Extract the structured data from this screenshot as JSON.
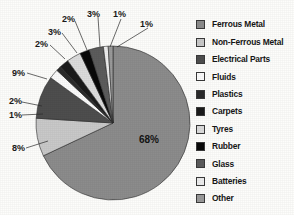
{
  "chart_data": {
    "type": "pie",
    "title": "",
    "legend_position": "right",
    "categories": [
      "Ferrous Metal",
      "Non-Ferrous Metal",
      "Electrical Parts",
      "Fluids",
      "Plastics",
      "Carpets",
      "Tyres",
      "Rubber",
      "Glass",
      "Batteries",
      "Other"
    ],
    "values": [
      68,
      8,
      9,
      2,
      1,
      2,
      3,
      2,
      3,
      1,
      1
    ],
    "value_labels": [
      "68%",
      "8%",
      "9%",
      "2%",
      "1%",
      "2%",
      "3%",
      "2%",
      "3%",
      "1%",
      "1%"
    ],
    "colors": [
      "#8c8c8c",
      "#c9c9c9",
      "#4e4e4e",
      "#fbfbfb",
      "#2b2b2b",
      "#1b1b1b",
      "#dcdcdc",
      "#090909",
      "#5c5c5c",
      "#ededed",
      "#9a9a9a"
    ]
  },
  "legend": {
    "items": [
      {
        "label": "Ferrous Metal",
        "color": "#8c8c8c"
      },
      {
        "label": "Non-Ferrous Metal",
        "color": "#c9c9c9"
      },
      {
        "label": "Electrical Parts",
        "color": "#4e4e4e"
      },
      {
        "label": "Fluids",
        "color": "#fbfbfb"
      },
      {
        "label": "Plastics",
        "color": "#2b2b2b"
      },
      {
        "label": "Carpets",
        "color": "#1b1b1b"
      },
      {
        "label": "Tyres",
        "color": "#dcdcdc"
      },
      {
        "label": "Rubber",
        "color": "#090909"
      },
      {
        "label": "Glass",
        "color": "#5c5c5c"
      },
      {
        "label": "Batteries",
        "color": "#ededed"
      },
      {
        "label": "Other",
        "color": "#9a9a9a"
      }
    ]
  },
  "pie_geometry": {
    "cx": 113,
    "cy": 123,
    "r": 77
  },
  "callouts": [
    {
      "text": "68%",
      "x": 139,
      "y": 143,
      "leader": false
    },
    {
      "text": "8%",
      "x": 12,
      "y": 151,
      "leader": true,
      "lx1": 26,
      "ly1": 148,
      "lx2": 48,
      "ly2": 141
    },
    {
      "text": "1%",
      "x": 9,
      "y": 118,
      "leader": true,
      "lx1": 22,
      "ly1": 115,
      "lx2": 43,
      "ly2": 114
    },
    {
      "text": "2%",
      "x": 9,
      "y": 104,
      "leader": true,
      "lx1": 22,
      "ly1": 102,
      "lx2": 42,
      "ly2": 106
    },
    {
      "text": "9%",
      "x": 12,
      "y": 76,
      "leader": true,
      "lx1": 27,
      "ly1": 73,
      "lx2": 47,
      "ly2": 79
    },
    {
      "text": "2%",
      "x": 35,
      "y": 47,
      "leader": true,
      "lx1": 50,
      "ly1": 45,
      "lx2": 65,
      "ly2": 59
    },
    {
      "text": "3%",
      "x": 48,
      "y": 35,
      "leader": true,
      "lx1": 62,
      "ly1": 33,
      "lx2": 77,
      "ly2": 53
    },
    {
      "text": "2%",
      "x": 62,
      "y": 22,
      "leader": true,
      "lx1": 75,
      "ly1": 21,
      "lx2": 87,
      "ly2": 50
    },
    {
      "text": "3%",
      "x": 87,
      "y": 17,
      "leader": true,
      "lx1": 98,
      "ly1": 17,
      "lx2": 100,
      "ly2": 47
    },
    {
      "text": "1%",
      "x": 113,
      "y": 17,
      "leader": true,
      "lx1": 121,
      "ly1": 19,
      "lx2": 110,
      "ly2": 47
    },
    {
      "text": "1%",
      "x": 140,
      "y": 27,
      "leader": true,
      "lx1": 148,
      "ly1": 28,
      "lx2": 117,
      "ly2": 47
    }
  ]
}
